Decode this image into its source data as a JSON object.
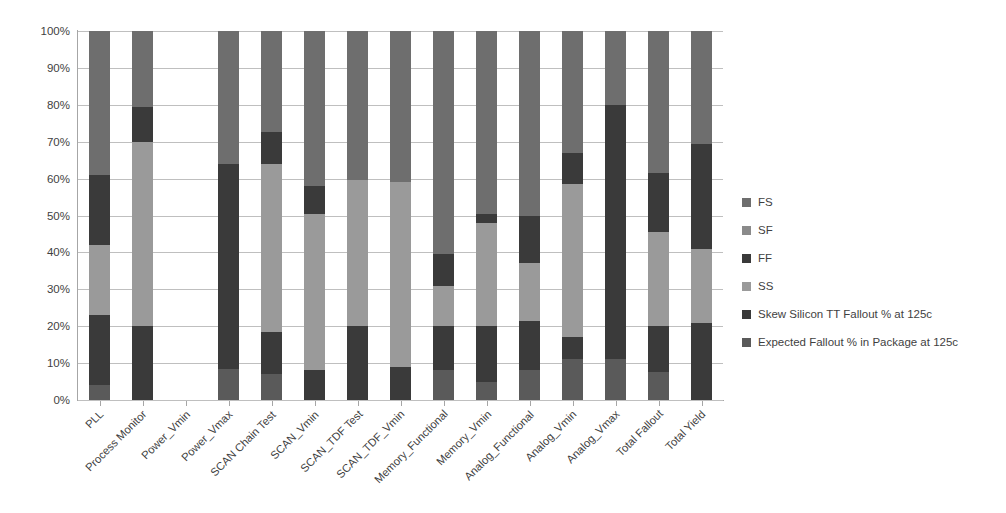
{
  "chart_data": {
    "type": "bar",
    "subtype": "100% stacked column",
    "title": "",
    "xlabel": "",
    "ylabel": "",
    "ylim": [
      0,
      100
    ],
    "yticks": [
      "0%",
      "10%",
      "20%",
      "30%",
      "40%",
      "50%",
      "60%",
      "70%",
      "80%",
      "90%",
      "100%"
    ],
    "ytick_values": [
      0,
      10,
      20,
      30,
      40,
      50,
      60,
      70,
      80,
      90,
      100
    ],
    "grid": true,
    "legend_position": "right",
    "categories": [
      "PLL",
      "Process Monitor",
      "Power_Vmin",
      "Power_Vmax",
      "SCAN Chain Test",
      "SCAN_Vmin",
      "SCAN_TDF Test",
      "SCAN_TDF_Vmin",
      "Memory_Functional",
      "Memory_Vmin",
      "Analog_Functional",
      "Analog_Vmin",
      "Analog_Vmax",
      "Total Fallout",
      "Total Yield"
    ],
    "series": [
      {
        "name": "Expected Fallout % in Package at 125c",
        "color": "#5a5a5a",
        "values": [
          4,
          0,
          0,
          8.5,
          7,
          0,
          0,
          0,
          8,
          5,
          8,
          11,
          11,
          7.5,
          0
        ]
      },
      {
        "name": "Skew Silicon TT Fallout % at 125c",
        "color": "#3a3a3a",
        "values": [
          19,
          20,
          0,
          11.5,
          11.5,
          8,
          20,
          9,
          12,
          15,
          13.5,
          6,
          9,
          12.5,
          21
        ]
      },
      {
        "name": "SS",
        "color": "#9a9a9a",
        "values": [
          19,
          50,
          0,
          0,
          45.5,
          42.5,
          39.5,
          50,
          11,
          28,
          15.5,
          41.5,
          0,
          25.5,
          20
        ]
      },
      {
        "name": "FF",
        "color": "#3a3a3a",
        "values": [
          19,
          9.5,
          0,
          44,
          8.5,
          7.5,
          0,
          0,
          8.5,
          2.5,
          13,
          8.5,
          60,
          16,
          28.5
        ]
      },
      {
        "name": "SF",
        "color": "#8a8a8a",
        "values": [
          0,
          0,
          0,
          0,
          0,
          0,
          0,
          0,
          0,
          0,
          0,
          0,
          0,
          0,
          0
        ]
      },
      {
        "name": "FS",
        "color": "#6e6e6e",
        "values": [
          39,
          20.5,
          0,
          36,
          27.5,
          42,
          40.5,
          41,
          60.5,
          49.5,
          50,
          33,
          20,
          38.5,
          30.5
        ]
      }
    ]
  },
  "legend": {
    "items": [
      {
        "label": "FS",
        "color": "#6e6e6e"
      },
      {
        "label": "SF",
        "color": "#8a8a8a"
      },
      {
        "label": "FF",
        "color": "#3a3a3a"
      },
      {
        "label": "SS",
        "color": "#9a9a9a"
      },
      {
        "label": "Skew Silicon TT Fallout % at 125c",
        "color": "#3a3a3a"
      },
      {
        "label": "Expected Fallout % in Package at 125c",
        "color": "#5a5a5a"
      }
    ]
  },
  "axis": {
    "y_labels": [
      "100%",
      "90%",
      "80%",
      "70%",
      "60%",
      "50%",
      "40%",
      "30%",
      "20%",
      "10%",
      "0%"
    ]
  },
  "colors": {
    "gridline": "#bfbfbf",
    "axis": "#a6a6a6",
    "text": "#3f3f3f",
    "background": "#ffffff"
  }
}
